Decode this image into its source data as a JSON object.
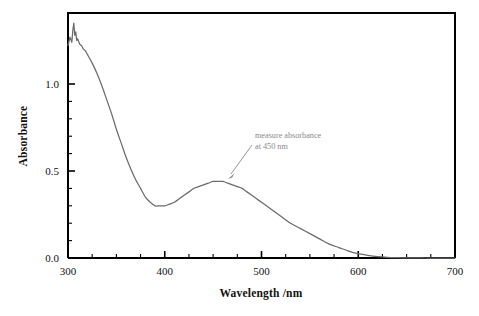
{
  "chart_data": {
    "type": "line",
    "title": "",
    "subtitle": "",
    "xlabel": "Wavelength /nm",
    "ylabel": "Absorbance",
    "xlim": [
      300,
      700
    ],
    "ylim": [
      0.0,
      1.4
    ],
    "grid": false,
    "legend": false,
    "legend_position": "none",
    "x_major_ticks": [
      300,
      400,
      500,
      600,
      700
    ],
    "x_major_tick_labels": [
      "300",
      "400",
      "500",
      "600",
      "700"
    ],
    "x_minor_tick_interval": 25,
    "y_major_ticks": [
      0.0,
      0.5,
      1.0
    ],
    "y_major_tick_labels": [
      "0.0",
      "0.5",
      "1.0"
    ],
    "y_minor_tick_interval": 0.1,
    "series": [
      {
        "name": "absorbance-spectrum",
        "color": "#6b6b6b",
        "x": [
          300,
          302,
          304,
          305,
          306,
          307,
          308,
          309,
          310,
          312,
          314,
          316,
          318,
          320,
          325,
          330,
          335,
          340,
          345,
          350,
          355,
          360,
          365,
          370,
          375,
          380,
          385,
          390,
          395,
          400,
          405,
          410,
          415,
          420,
          425,
          430,
          435,
          440,
          445,
          450,
          455,
          460,
          465,
          470,
          475,
          480,
          485,
          490,
          495,
          500,
          510,
          520,
          530,
          540,
          550,
          560,
          570,
          580,
          590,
          600,
          610,
          620,
          630,
          640,
          650,
          660,
          670,
          680,
          690,
          700
        ],
        "y": [
          1.22,
          1.27,
          1.24,
          1.31,
          1.35,
          1.28,
          1.3,
          1.25,
          1.26,
          1.23,
          1.22,
          1.2,
          1.19,
          1.17,
          1.12,
          1.06,
          0.99,
          0.91,
          0.83,
          0.74,
          0.66,
          0.58,
          0.51,
          0.45,
          0.4,
          0.35,
          0.32,
          0.3,
          0.3,
          0.3,
          0.31,
          0.32,
          0.34,
          0.36,
          0.38,
          0.4,
          0.41,
          0.42,
          0.43,
          0.44,
          0.44,
          0.44,
          0.43,
          0.42,
          0.41,
          0.4,
          0.38,
          0.36,
          0.34,
          0.32,
          0.28,
          0.24,
          0.2,
          0.17,
          0.14,
          0.11,
          0.08,
          0.06,
          0.04,
          0.025,
          0.015,
          0.008,
          0.004,
          0.002,
          0.001,
          0.001,
          0.0,
          0.0,
          0.0,
          0.0
        ]
      }
    ],
    "annotations": [
      {
        "name": "measure-absorbance-note",
        "line1": "measure absorbance",
        "line2": "at 450 nm",
        "color": "#8a8a8a",
        "points_to_x": 452,
        "points_to_y": 0.45
      }
    ]
  }
}
